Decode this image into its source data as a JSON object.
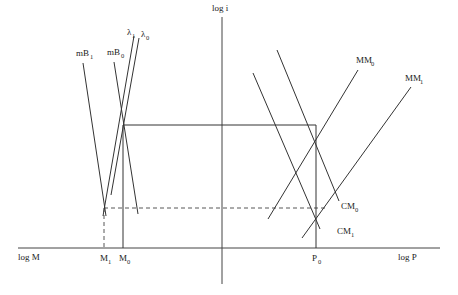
{
  "diagram": {
    "axes": {
      "vertical_label": "log i",
      "left_label": "log M",
      "right_label": "log P"
    },
    "curves": {
      "mB1": {
        "base": "mB",
        "sub": "1"
      },
      "mB0": {
        "base": "mB",
        "sub": "0"
      },
      "lambda1": {
        "base": "λ",
        "sub": "1"
      },
      "lambda0": {
        "base": "λ",
        "sub": "0"
      },
      "MM0": {
        "base": "MM",
        "sub": "0"
      },
      "MM1": {
        "base": "MM",
        "sub": "1"
      },
      "CM0": {
        "base": "CM",
        "sub": "0"
      },
      "CM1": {
        "base": "CM",
        "sub": "1"
      }
    },
    "ticks": {
      "M1": {
        "base": "M",
        "sub": "1"
      },
      "M0": {
        "base": "M",
        "sub": "0"
      },
      "P0": {
        "base": "P",
        "sub": "0"
      }
    }
  }
}
